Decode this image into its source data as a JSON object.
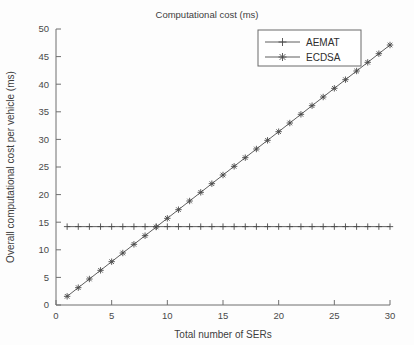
{
  "chart_data": {
    "type": "line",
    "title": "Computational cost (ms)",
    "xlabel": "Total number of SERs",
    "ylabel": "Overall computational cost per vehicle (ms)",
    "xlim": [
      0,
      30
    ],
    "ylim": [
      0,
      50
    ],
    "xticks": [
      0,
      5,
      10,
      15,
      20,
      25,
      30
    ],
    "yticks": [
      0,
      5,
      10,
      15,
      20,
      25,
      30,
      35,
      40,
      45,
      50
    ],
    "grid": false,
    "legend_position": "upper right",
    "x": [
      1,
      2,
      3,
      4,
      5,
      6,
      7,
      8,
      9,
      10,
      11,
      12,
      13,
      14,
      15,
      16,
      17,
      18,
      19,
      20,
      21,
      22,
      23,
      24,
      25,
      26,
      27,
      28,
      29,
      30
    ],
    "series": [
      {
        "name": "AEMAT",
        "marker": "plus",
        "line_style": "solid",
        "color": "#4d4d4d",
        "values": [
          14.2,
          14.2,
          14.2,
          14.2,
          14.2,
          14.2,
          14.2,
          14.2,
          14.2,
          14.2,
          14.2,
          14.2,
          14.2,
          14.2,
          14.2,
          14.2,
          14.2,
          14.2,
          14.2,
          14.2,
          14.2,
          14.2,
          14.2,
          14.2,
          14.2,
          14.2,
          14.2,
          14.2,
          14.2,
          14.2
        ]
      },
      {
        "name": "ECDSA",
        "marker": "asterisk",
        "line_style": "solid",
        "color": "#4d4d4d",
        "values": [
          1.57,
          3.14,
          4.71,
          6.28,
          7.85,
          9.42,
          10.99,
          12.56,
          14.13,
          15.7,
          17.27,
          18.84,
          20.41,
          21.98,
          23.55,
          25.12,
          26.69,
          28.26,
          29.83,
          31.4,
          32.97,
          34.54,
          36.11,
          37.68,
          39.25,
          40.82,
          42.39,
          43.96,
          45.53,
          47.1
        ]
      }
    ]
  },
  "legend": {
    "entries": [
      {
        "label": "AEMAT",
        "marker": "plus-marker-icon"
      },
      {
        "label": "ECDSA",
        "marker": "asterisk-marker-icon"
      }
    ]
  },
  "axis_tick_labels": {
    "x": [
      "0",
      "5",
      "10",
      "15",
      "20",
      "25",
      "30"
    ],
    "y": [
      "0",
      "5",
      "10",
      "15",
      "20",
      "25",
      "30",
      "35",
      "40",
      "45",
      "50"
    ]
  },
  "colors": {
    "line": "#4d4d4d",
    "axis": "#6f6f6f",
    "text": "#3d3d3d",
    "background": "#fdfdfd"
  }
}
